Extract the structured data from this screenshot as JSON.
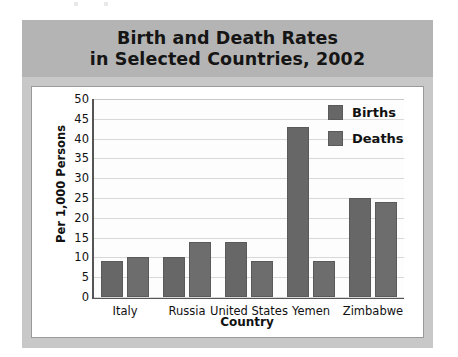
{
  "chart_data": {
    "type": "bar",
    "title": "Birth and Death Rates in Selected Countries, 2002",
    "title_line1": "Birth and Death Rates",
    "title_line2": "in Selected Countries, 2002",
    "xlabel": "Country",
    "ylabel": "Per 1,000  Persons",
    "categories": [
      "Italy",
      "Russia",
      "United States",
      "Yemen",
      "Zimbabwe"
    ],
    "series": [
      {
        "name": "Births",
        "values": [
          9,
          10,
          14,
          43,
          25
        ],
        "color": "#676767"
      },
      {
        "name": "Deaths",
        "values": [
          10,
          14,
          9,
          9,
          24
        ],
        "color": "#6d6d6d"
      }
    ],
    "ylim": [
      0,
      50
    ],
    "yticks": [
      0,
      5,
      10,
      15,
      20,
      25,
      30,
      35,
      40,
      45,
      50
    ],
    "grid": true,
    "legend_position": "top-right",
    "banner_color": "#b4b4b4",
    "card_color": "#c8c8c8",
    "plot_background": "#ffffff"
  }
}
